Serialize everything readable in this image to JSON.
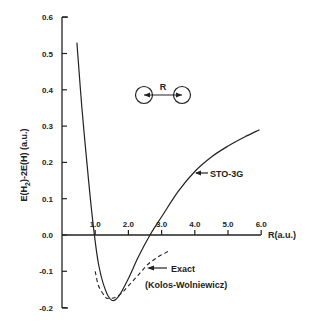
{
  "chart_data": {
    "type": "line",
    "title": "",
    "xlabel": "R (a.u.)",
    "ylabel": "E(H2)-2E(H) (a.u.)",
    "xlim": [
      0,
      6.0
    ],
    "ylim": [
      -0.2,
      0.6
    ],
    "grid": false,
    "x_ticks": [
      "1.0",
      "2.0",
      "3.0",
      "4.0",
      "5.0",
      "6.0"
    ],
    "y_ticks": [
      "0.6",
      "0.5",
      "0.4",
      "0.3",
      "0.2",
      "0.1",
      "0.0",
      "-0.1",
      "-0.2"
    ],
    "series": [
      {
        "name": "STO-3G",
        "style": "solid",
        "x": [
          0.45,
          0.6,
          0.8,
          0.95,
          1.1,
          1.3,
          1.5,
          1.7,
          2.0,
          2.3,
          2.65,
          3.0,
          3.5,
          4.0,
          4.5,
          5.0,
          5.5,
          5.95
        ],
        "y": [
          0.53,
          0.35,
          0.15,
          0.02,
          -0.08,
          -0.15,
          -0.18,
          -0.17,
          -0.12,
          -0.06,
          0.0,
          0.05,
          0.12,
          0.175,
          0.215,
          0.245,
          0.27,
          0.29
        ]
      },
      {
        "name": "Exact (Kolos-Wolniewicz)",
        "style": "dashed",
        "x": [
          1.0,
          1.1,
          1.3,
          1.4,
          1.6,
          1.8,
          2.0,
          2.3,
          2.6,
          2.9,
          3.2
        ],
        "y": [
          -0.1,
          -0.14,
          -0.17,
          -0.175,
          -0.172,
          -0.16,
          -0.14,
          -0.11,
          -0.08,
          -0.06,
          -0.045
        ]
      }
    ],
    "annotations": [
      {
        "text": "STO-3G",
        "arrow_to": "STO-3G curve near R=4.0"
      },
      {
        "text": "Exact",
        "arrow_to": "dashed curve near R=2.8"
      },
      {
        "text": "(Kolos-Wolniewicz)"
      },
      {
        "text": "R",
        "note": "H2 molecule diagram: two circles separated by distance R"
      }
    ]
  },
  "labels": {
    "ylabel_main": "E(H",
    "ylabel_sub": "2",
    "ylabel_rest": ")-2E(H)  (a.u.)",
    "xlabel": "R(a.u.)",
    "sto_label": "STO-3G",
    "exact_label": "Exact",
    "kolos_label": "(Kolos-Wolniewicz)",
    "molecule_r": "R"
  }
}
